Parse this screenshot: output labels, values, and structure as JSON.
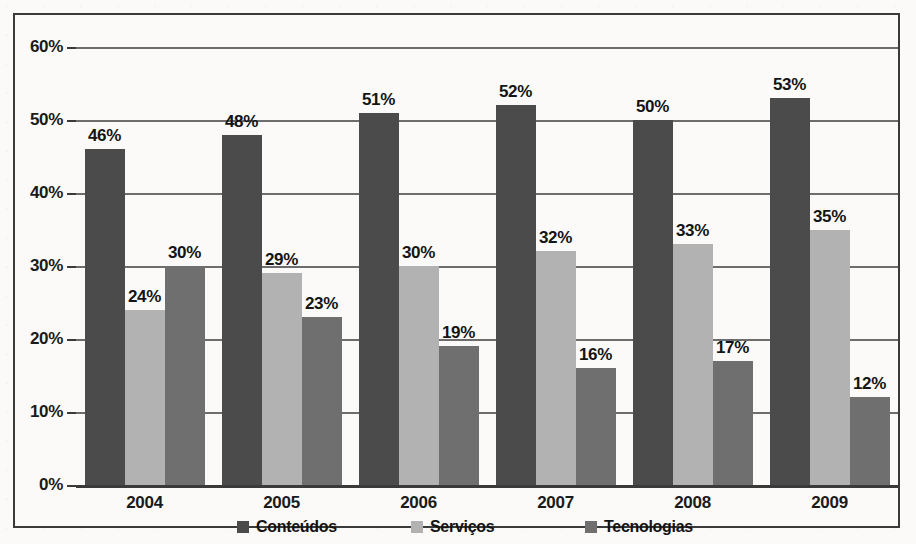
{
  "chart_data": {
    "type": "bar",
    "title": "",
    "xlabel": "",
    "ylabel": "",
    "categories": [
      "2004",
      "2005",
      "2006",
      "2007",
      "2008",
      "2009"
    ],
    "series": [
      {
        "name": "Conteúdos",
        "color": "#4b4b4b",
        "values": [
          46,
          48,
          51,
          52,
          50,
          53
        ],
        "labels": [
          "46%",
          "48%",
          "51%",
          "52%",
          "50%",
          "53%"
        ]
      },
      {
        "name": "Serviços",
        "color": "#b2b2b2",
        "values": [
          24,
          29,
          30,
          32,
          33,
          35
        ],
        "labels": [
          "24%",
          "29%",
          "30%",
          "32%",
          "33%",
          "35%"
        ]
      },
      {
        "name": "Tecnologias",
        "color": "#6f6f6f",
        "values": [
          30,
          23,
          19,
          16,
          17,
          12
        ],
        "labels": [
          "30%",
          "23%",
          "19%",
          "16%",
          "17%",
          "12%"
        ]
      }
    ],
    "ylim": [
      0,
      60
    ],
    "ytick_values": [
      0,
      10,
      20,
      30,
      40,
      50,
      60
    ],
    "ytick_labels": [
      "0%",
      "10%",
      "20%",
      "30%",
      "40%",
      "50%",
      "60%"
    ],
    "grid": true,
    "grid_axis": "y",
    "legend_position": "bottom",
    "value_unit": "%"
  },
  "legend": {
    "items": [
      {
        "label": "Conteúdos",
        "swatch": "legend-swatch-conteudos"
      },
      {
        "label": "Serviços",
        "swatch": "legend-swatch-servicos"
      },
      {
        "label": "Tecnologias",
        "swatch": "legend-swatch-tecnologias"
      }
    ]
  },
  "colors": {
    "series_conteudos": "#4b4b4b",
    "series_servicos": "#b2b2b2",
    "series_tecnologias": "#6f6f6f",
    "gridline": "#6d6d6d",
    "axis": "#3a3a3a",
    "frame": "#3a3a3a",
    "background": "#fbfaf8",
    "text": "#141414"
  }
}
